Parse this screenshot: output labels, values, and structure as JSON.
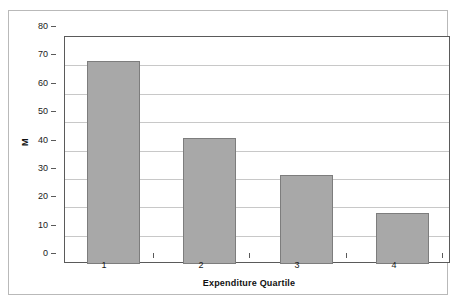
{
  "chart_data": {
    "type": "bar",
    "title": "",
    "subtitle": "",
    "xlabel": "Expenditure Quartile",
    "ylabel": "M",
    "categories": [
      "1",
      "2",
      "3",
      "4"
    ],
    "values": [
      71.5,
      44.5,
      31.5,
      18
    ],
    "series": [
      {
        "name": "",
        "values": [
          71.5,
          44.5,
          31.5,
          18
        ]
      }
    ],
    "ylim": [
      0,
      80
    ],
    "ytick_labels": [
      "80",
      "70",
      "60",
      "50",
      "40",
      "30",
      "20",
      "10",
      "0"
    ],
    "ytick_values": [
      80,
      70,
      60,
      50,
      40,
      30,
      20,
      10,
      0
    ],
    "ytick_step": 10,
    "grid": "horizontal",
    "legend": "none",
    "annotations": [],
    "colors": {
      "bar_fill": "#a8a8a8",
      "bar_border": "#7d7d7d",
      "gridline": "#c8c8c8",
      "axis_line": "#5a5a5a",
      "outer_frame": "#b9b9b9",
      "text": "#1a1a1a",
      "plot_background": "#ffffff"
    }
  }
}
